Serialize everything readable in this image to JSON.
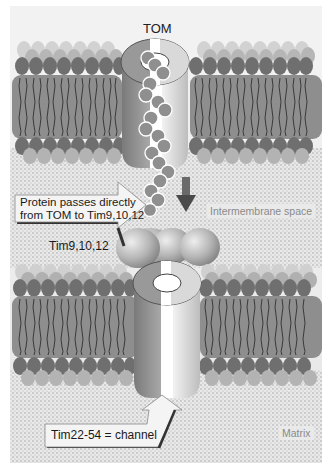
{
  "diagram": {
    "labels": {
      "tom": "TOM",
      "tim9": "Tim9,10,12",
      "intermembrane_space": "Intermembrane space",
      "matrix": "Matrix"
    },
    "callouts": {
      "protein_passes_line1": "Protein passes directly",
      "protein_passes_line2": "from TOM to Tim9,10,12",
      "tim22": "Tim22-54 = channel"
    },
    "components": [
      {
        "name": "outer-membrane",
        "type": "lipid-bilayer"
      },
      {
        "name": "tom-complex",
        "type": "channel-cylinder"
      },
      {
        "name": "precursor-protein",
        "type": "bead-chain"
      },
      {
        "name": "tim9-10-12-complex",
        "type": "sphere-trio"
      },
      {
        "name": "inner-membrane",
        "type": "lipid-bilayer"
      },
      {
        "name": "tim22-54-channel",
        "type": "channel-cylinder"
      }
    ],
    "colors": {
      "background": "#ebebeb",
      "membrane_body": "#8c8c8c",
      "head_dark": "#6e6e6e",
      "head_light": "#b4b4b4",
      "protein_bead": "#8f8f8f",
      "arrow": "#555555"
    }
  }
}
